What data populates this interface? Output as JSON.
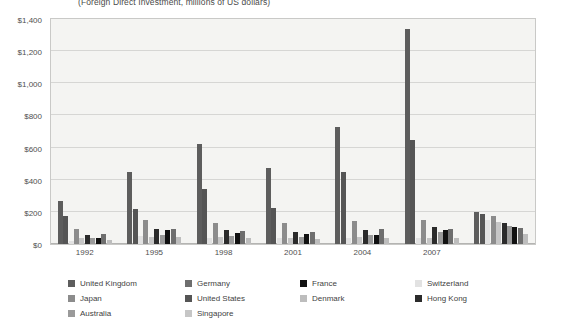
{
  "chart": {
    "title": "(Foreign Direct Investment, millions of US dollars)",
    "ylabels": [
      "$1,400",
      "$1,200",
      "$1,000",
      "$800",
      "$600",
      "$400",
      "$200",
      "$0"
    ],
    "xlabels": [
      "1992",
      "1995",
      "1998",
      "2001",
      "2004",
      "2007"
    ]
  },
  "legend": {
    "items": [
      {
        "label": "United Kingdom",
        "color": "#5d5d5d"
      },
      {
        "label": "United States",
        "color": "#555555"
      },
      {
        "label": "Switzerland",
        "color": "#e2e2e2"
      },
      {
        "label": "Japan",
        "color": "#8c8c8c"
      },
      {
        "label": "Singapore",
        "color": "#c6c6c6"
      },
      {
        "label": "Hong Kong",
        "color": "#2b2b2b"
      },
      {
        "label": "Australia",
        "color": "#9a9a9a"
      },
      {
        "label": "France",
        "color": "#111111"
      },
      {
        "label": "Germany",
        "color": "#6e6e6e"
      },
      {
        "label": "Denmark",
        "color": "#bdbdbd"
      }
    ]
  },
  "chart_data": {
    "type": "bar",
    "title": "(Foreign Direct Investment, millions of US dollars)",
    "xlabel": "",
    "ylabel": "",
    "ylim": [
      0,
      1400
    ],
    "ytick_step": 200,
    "grid": true,
    "legend_position": "bottom",
    "categories": [
      "1992",
      "1995",
      "1997",
      "2000",
      "2003",
      "2006",
      "2007"
    ],
    "series": [
      {
        "name": "United Kingdom",
        "color": "#5d5d5d",
        "values": [
          270,
          450,
          620,
          475,
          730,
          1340,
          200
        ]
      },
      {
        "name": "United States",
        "color": "#555555",
        "values": [
          175,
          215,
          340,
          225,
          450,
          650,
          185
        ]
      },
      {
        "name": "Switzerland",
        "color": "#e2e2e2",
        "values": [
          20,
          50,
          40,
          35,
          35,
          35,
          150
        ]
      },
      {
        "name": "Japan",
        "color": "#8c8c8c",
        "values": [
          95,
          150,
          130,
          130,
          145,
          150,
          175
        ]
      },
      {
        "name": "Singapore",
        "color": "#c6c6c6",
        "values": [
          35,
          45,
          45,
          40,
          45,
          40,
          140
        ]
      },
      {
        "name": "Hong Kong",
        "color": "#2b2b2b",
        "values": [
          55,
          95,
          85,
          75,
          85,
          105,
          130
        ]
      },
      {
        "name": "Australia",
        "color": "#9a9a9a",
        "values": [
          35,
          55,
          50,
          45,
          55,
          75,
          115
        ]
      },
      {
        "name": "France",
        "color": "#111111",
        "values": [
          40,
          85,
          70,
          65,
          55,
          85,
          105
        ]
      },
      {
        "name": "Germany",
        "color": "#6e6e6e",
        "values": [
          60,
          95,
          80,
          75,
          95,
          95,
          100
        ]
      },
      {
        "name": "Denmark",
        "color": "#bdbdbd",
        "values": [
          25,
          45,
          35,
          30,
          40,
          35,
          60
        ]
      }
    ]
  }
}
